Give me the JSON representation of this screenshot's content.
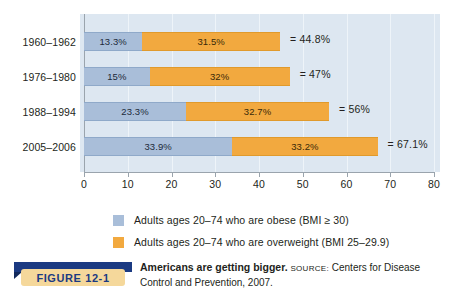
{
  "figure": {
    "badge_label": "FIGURE  12-1",
    "caption_title": "Americans are getting bigger.",
    "source_label": "Source:",
    "source_text": "Centers for Disease Control and Prevention, 2007."
  },
  "legend": {
    "items": [
      {
        "label": "Adults ages 20–74 who are obese (BMI ≥ 30)",
        "color": "#a9bed9",
        "swatch_name": "obese"
      },
      {
        "label": "Adults ages 20–74 who are overweight (BMI 25–29.9)",
        "color": "#f2a93f",
        "swatch_name": "overweight"
      }
    ]
  },
  "chart_data": {
    "type": "bar",
    "orientation": "horizontal",
    "stacked": true,
    "title": "Americans are getting bigger.",
    "xlabel": "",
    "ylabel": "",
    "xlim": [
      0,
      80
    ],
    "xticks": [
      0,
      10,
      20,
      30,
      40,
      50,
      60,
      70,
      80
    ],
    "xtick_labels": [
      "0",
      "10",
      "20",
      "30",
      "40",
      "50",
      "60",
      "70",
      "80"
    ],
    "grid": true,
    "legend_position": "bottom",
    "categories": [
      "1960–1962",
      "1976–1980",
      "1988–1994",
      "2005–2006"
    ],
    "series": [
      {
        "name": "Adults ages 20–74 who are obese (BMI ≥ 30)",
        "color": "#a9bed9",
        "values": [
          13.3,
          15,
          23.3,
          33.9
        ],
        "labels": [
          "13.3%",
          "15%",
          "23.3%",
          "33.9%"
        ]
      },
      {
        "name": "Adults ages 20–74 who are overweight (BMI 25–29.9)",
        "color": "#f2a93f",
        "values": [
          31.5,
          32,
          32.7,
          33.2
        ],
        "labels": [
          "31.5%",
          "32%",
          "32.7%",
          "33.2%"
        ]
      }
    ],
    "totals": [
      44.8,
      47,
      56,
      67.1
    ],
    "total_labels": [
      "= 44.8%",
      "= 47%",
      "= 56%",
      "= 67.1%"
    ]
  },
  "colors": {
    "panel_background": "#dde7f1",
    "obese": "#a9bed9",
    "overweight": "#f2a93f",
    "axis": "#9aa4ad",
    "banner_blue": "#1b3a82",
    "badge_tan": "#f5d89b"
  }
}
